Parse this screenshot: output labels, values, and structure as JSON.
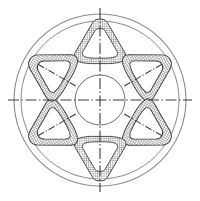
{
  "document": {
    "title": "Wheel Cross-Section Technical Drawing",
    "background_color": "#ffffff"
  },
  "canvas": {
    "width": 200,
    "height": 201
  },
  "chart_data": {
    "type": "diagram",
    "center": {
      "x": 100,
      "y": 100
    },
    "circles": [
      {
        "name": "outer-rim-circle",
        "radius": 86,
        "stroke": "#8a8a8a",
        "stroke_width": 1.1
      },
      {
        "name": "inner-rim-circle",
        "radius": 79,
        "stroke": "#8a8a8a",
        "stroke_width": 1.0
      },
      {
        "name": "hub-circle",
        "radius": 25,
        "stroke": "#6e6e6e",
        "stroke_width": 1.0
      }
    ],
    "segments": {
      "count": 6,
      "angles_deg": [
        0,
        60,
        120,
        180,
        240,
        300
      ],
      "shape": "rounded-triangle-ring",
      "outer_triangle_radius": 32,
      "inner_triangle_radius": 19,
      "corner_radius_outer": 9,
      "corner_radius_inner": 6,
      "centroid_radius": 50,
      "fill": "cross-hatch",
      "hatch_spacing_px": 2.2,
      "hatch_color": "#4a4a4a",
      "stroke": "#3c3c3c",
      "stroke_width": 0.9
    },
    "centerlines": {
      "style": "dash-dot",
      "color": "#3a3a3a",
      "stroke_width": 1.1,
      "horizontal": {
        "x1": 8,
        "y1": 100,
        "x2": 192,
        "y2": 100
      },
      "vertical": {
        "x1": 100,
        "y1": 8,
        "x2": 100,
        "y2": 192
      },
      "spoke_marks_deg": [
        60,
        120,
        240,
        300
      ],
      "spoke_mark_inner_radius": 28,
      "spoke_mark_outer_radius": 72
    }
  },
  "labels": {
    "none_visible": ""
  }
}
